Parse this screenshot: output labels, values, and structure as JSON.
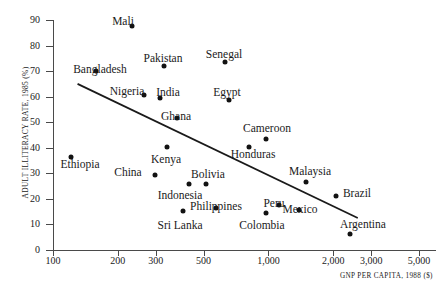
{
  "chart_data": {
    "type": "scatter",
    "title": "",
    "xlabel": "GNP PER CAPITA, 1988 ($)",
    "ylabel": "ADULT ILLITERACY RATE, 1985 (%)",
    "xscale": "log",
    "xlim": [
      100,
      6000
    ],
    "ylim": [
      0,
      90
    ],
    "xticks": [
      100,
      200,
      300,
      500,
      1000,
      2000,
      3000,
      5000
    ],
    "xtick_labels": [
      "100",
      "200",
      "300",
      "500",
      "1,000",
      "2,000",
      "3,000",
      "5,000"
    ],
    "yticks": [
      0,
      10,
      20,
      30,
      40,
      50,
      60,
      70,
      80,
      90
    ],
    "ytick_labels": [
      "0",
      "10",
      "20",
      "30",
      "40",
      "50",
      "60",
      "70",
      "80",
      "90"
    ],
    "grid": false,
    "legend": null,
    "point_color": "#121212",
    "line_color": "#1a1a1a",
    "trendline": {
      "x1": 130,
      "y1": 65,
      "x2": 2600,
      "y2": 12.5
    },
    "points": [
      {
        "label": "Mali",
        "x": 260,
        "y": 83,
        "lx": 242,
        "ly": 92,
        "px": 132,
        "py": 26,
        "lpx": 123,
        "lpy": 21.5
      },
      {
        "label": "Bangladesh",
        "x": 170,
        "y": 67,
        "lx": 147,
        "ly": 72.5,
        "px": 96,
        "py": 71,
        "lpx": 100,
        "lpy": 69.5
      },
      {
        "label": "Pakistan",
        "x": 350,
        "y": 70,
        "lx": 345,
        "ly": 75.5,
        "px": 164,
        "py": 66,
        "lpx": 163,
        "lpy": 58.5
      },
      {
        "label": "Senegal",
        "x": 650,
        "y": 71.5,
        "lx": 660,
        "ly": 77,
        "px": 225,
        "py": 62,
        "lpx": 224,
        "lpy": 54.5
      },
      {
        "label": "Nigeria",
        "x": 290,
        "y": 58,
        "lx": 240,
        "ly": 62,
        "px": 144,
        "py": 95,
        "lpx": 127,
        "lpy": 92
      },
      {
        "label": "India",
        "x": 340,
        "y": 57,
        "lx": 365,
        "ly": 61.5,
        "px": 160,
        "py": 98,
        "lpx": 168,
        "lpy": 93
      },
      {
        "label": "Egypt",
        "x": 680,
        "y": 56,
        "lx": 690,
        "ly": 61.5,
        "px": 229,
        "py": 100,
        "lpx": 227,
        "lpy": 93
      },
      {
        "label": "Ghana",
        "x": 400,
        "y": 47,
        "lx": 405,
        "ly": 52,
        "px": 177,
        "py": 118,
        "lpx": 176,
        "lpy": 117
      },
      {
        "label": "Cameroon",
        "x": 1000,
        "y": 44,
        "lx": 1000,
        "ly": 49.5,
        "px": 266,
        "py": 139,
        "lpx": 267,
        "lpy": 129
      },
      {
        "label": "Honduras",
        "x": 880,
        "y": 41,
        "lx": 930,
        "ly": 36,
        "px": 249,
        "py": 147,
        "lpx": 253,
        "lpy": 155
      },
      {
        "label": "Ethiopia",
        "x": 125,
        "y": 38,
        "lx": 135,
        "ly": 33,
        "px": 71,
        "py": 157,
        "lpx": 80,
        "lpy": 165
      },
      {
        "label": "Kenya",
        "x": 380,
        "y": 41,
        "lx": 370,
        "ly": 35,
        "px": 167,
        "py": 147,
        "lpx": 166,
        "lpy": 160
      },
      {
        "label": "China",
        "x": 325,
        "y": 31,
        "lx": 240,
        "ly": 30,
        "px": 155,
        "py": 175,
        "lpx": 128,
        "lpy": 173
      },
      {
        "label": "Bolivia",
        "x": 560,
        "y": 26,
        "lx": 575,
        "ly": 31,
        "px": 206,
        "py": 184,
        "lpx": 208,
        "lpy": 175
      },
      {
        "label": "Indonesia",
        "x": 470,
        "y": 26,
        "lx": 430,
        "ly": 21,
        "px": 189,
        "py": 184,
        "lpx": 180,
        "lpy": 196
      },
      {
        "label": "Malaysia",
        "x": 1900,
        "y": 27,
        "lx": 1950,
        "ly": 32,
        "px": 306,
        "py": 182,
        "lpx": 310,
        "lpy": 172
      },
      {
        "label": "Brazil",
        "x": 2200,
        "y": 23,
        "lx": 2700,
        "ly": 23,
        "px": 336,
        "py": 196,
        "lpx": 357,
        "lpy": 194
      },
      {
        "label": "Philippines",
        "x": 620,
        "y": 14,
        "lx": 605,
        "ly": 19,
        "px": 216,
        "py": 208,
        "lpx": 216,
        "lpy": 207
      },
      {
        "label": "Peru",
        "x": 1300,
        "y": 16,
        "lx": 1230,
        "ly": 20,
        "px": 279,
        "py": 205,
        "lpx": 274,
        "lpy": 204
      },
      {
        "label": "Colombia",
        "x": 1150,
        "y": 13.5,
        "lx": 1140,
        "ly": 8.5,
        "px": 266,
        "py": 213,
        "lpx": 262,
        "lpy": 226
      },
      {
        "label": "Mexico",
        "x": 1750,
        "y": 14.5,
        "lx": 1750,
        "ly": 19,
        "px": 299,
        "py": 210,
        "lpx": 300,
        "lpy": 210
      },
      {
        "label": "Sri Lanka",
        "x": 440,
        "y": 13,
        "lx": 430,
        "ly": 8,
        "px": 183,
        "py": 211,
        "lpx": 180,
        "lpy": 226
      },
      {
        "label": "Argentina",
        "x": 2600,
        "y": 5,
        "lx": 2800,
        "ly": 10,
        "px": 350,
        "py": 234,
        "lpx": 363,
        "lpy": 225
      }
    ]
  },
  "axis": {
    "y_title": "ADULT ILLITERACY RATE, 1985 (%)",
    "x_title": "GNP PER CAPITA, 1988 ($)"
  }
}
